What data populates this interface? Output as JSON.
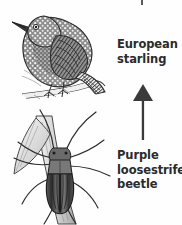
{
  "diagram": {
    "type": "food-chain",
    "background_color": "#fefefe",
    "ink_color": "#2b2b2b",
    "arrow_color": "#3a3a3a",
    "nodes": [
      {
        "id": "starling",
        "label_lines": [
          "European",
          "starling"
        ],
        "full_label": "European starling",
        "illustration": "perched-speckled-bird-on-branch",
        "trophic_level": "predator"
      },
      {
        "id": "beetle",
        "label_lines": [
          "Purple",
          "loosestrife",
          "beetle"
        ],
        "full_label": "Purple loosestrife beetle",
        "illustration": "long-antennae-beetle-on-plant-stem",
        "trophic_level": "herbivore"
      }
    ],
    "arrows": [
      {
        "id": "beetle-to-starling",
        "direction": "up",
        "from": "Purple loosestrife beetle",
        "to": "European starling",
        "meaning": "energy flows from beetle to starling"
      },
      {
        "id": "cropped-top-arrow",
        "direction": "up",
        "note": "tail fragment cut off by top edge of image"
      }
    ]
  },
  "labels": {
    "starling": {
      "line1": "European",
      "line2": "starling"
    },
    "beetle": {
      "line1": "Purple",
      "line2": "loosestrife",
      "line3": "beetle"
    }
  }
}
